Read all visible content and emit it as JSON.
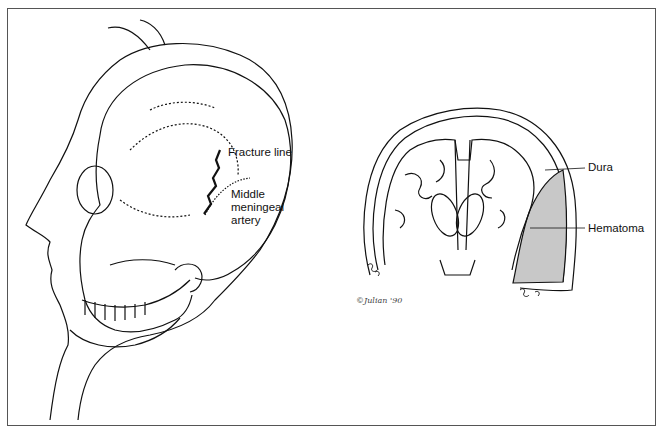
{
  "figure": {
    "left_panel": {
      "description": "Lateral view of head with skull showing fracture line",
      "labels": {
        "fracture": "Fracture line",
        "artery_line1": "Middle",
        "artery_line2": "meningeal",
        "artery_line3": "artery"
      }
    },
    "right_panel": {
      "description": "Coronal section of brain showing epidural hematoma",
      "labels": {
        "dura": "Dura",
        "hematoma": "Hematoma"
      },
      "signature": "©Julian '90"
    },
    "colors": {
      "line": "#111111",
      "hematoma_fill": "#c8c8c8",
      "border": "#555555"
    }
  }
}
